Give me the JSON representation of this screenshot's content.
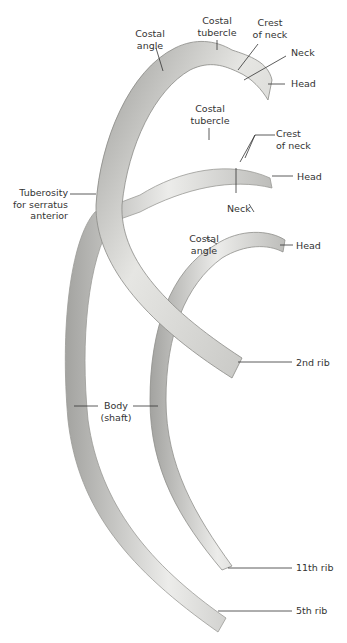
{
  "figure": {
    "colors": {
      "background": "#ffffff",
      "bone_light": "#e8e8e6",
      "bone_mid": "#c9c9c6",
      "bone_dark": "#8f8f8c",
      "leader": "#333333"
    }
  },
  "labels": {
    "costal_angle_top": [
      "Costal",
      "angle"
    ],
    "costal_tubercle_top": [
      "Costal",
      "tubercle"
    ],
    "crest_of_neck_top": [
      "Crest",
      "of neck"
    ],
    "neck_top": "Neck",
    "head_top": "Head",
    "costal_tubercle_mid": [
      "Costal",
      "tubercle"
    ],
    "crest_of_neck_mid": [
      "Crest",
      "of neck"
    ],
    "head_mid": "Head",
    "tuberosity": [
      "Tuberosity",
      "for serratus",
      "anterior"
    ],
    "neck_mid": "Neck",
    "costal_angle_low": [
      "Costal",
      "angle"
    ],
    "head_low": "Head",
    "rib_2nd": "2nd rib",
    "body_shaft": [
      "Body",
      "(shaft)"
    ],
    "rib_11th": "11th rib",
    "rib_5th": "5th rib"
  }
}
